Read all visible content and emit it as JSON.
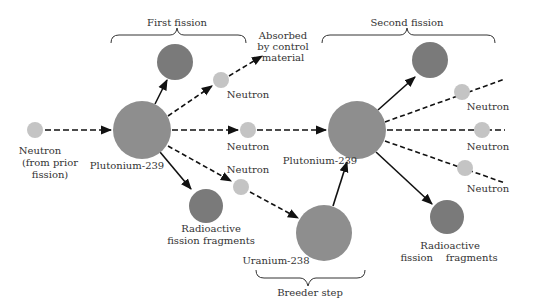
{
  "colors": {
    "neutron": "#c4c4c4",
    "nucleus": "#8e8e8e",
    "fragment": "#7a7a7a",
    "line": "#111111",
    "text": "#333333"
  },
  "groups": {
    "first_fission": "First fission",
    "second_fission": "Second fission",
    "breeder_step": "Breeder step"
  },
  "labels": {
    "neutron_prior_1": "Neutron",
    "neutron_prior_2": "(from prior",
    "neutron_prior_3": "fission)",
    "plutonium_1": "Plutonium-239",
    "plutonium_2": "Plutonium-239",
    "uranium": "Uranium-238",
    "absorbed_1": "Absorbed",
    "absorbed_2": "by control",
    "absorbed_3": "material",
    "neutron_absorbed": "Neutron",
    "neutron_mid": "Neutron",
    "neutron_lower": "Neutron",
    "fragments_1_line1": "Radioactive",
    "fragments_1_line2": "fission fragments",
    "fragments_2_line1": "Radioactive",
    "fragments_2_line2": "fission    fragments",
    "neutron_right_1": "Neutron",
    "neutron_right_2": "Neutron",
    "neutron_right_3": "Neutron"
  }
}
